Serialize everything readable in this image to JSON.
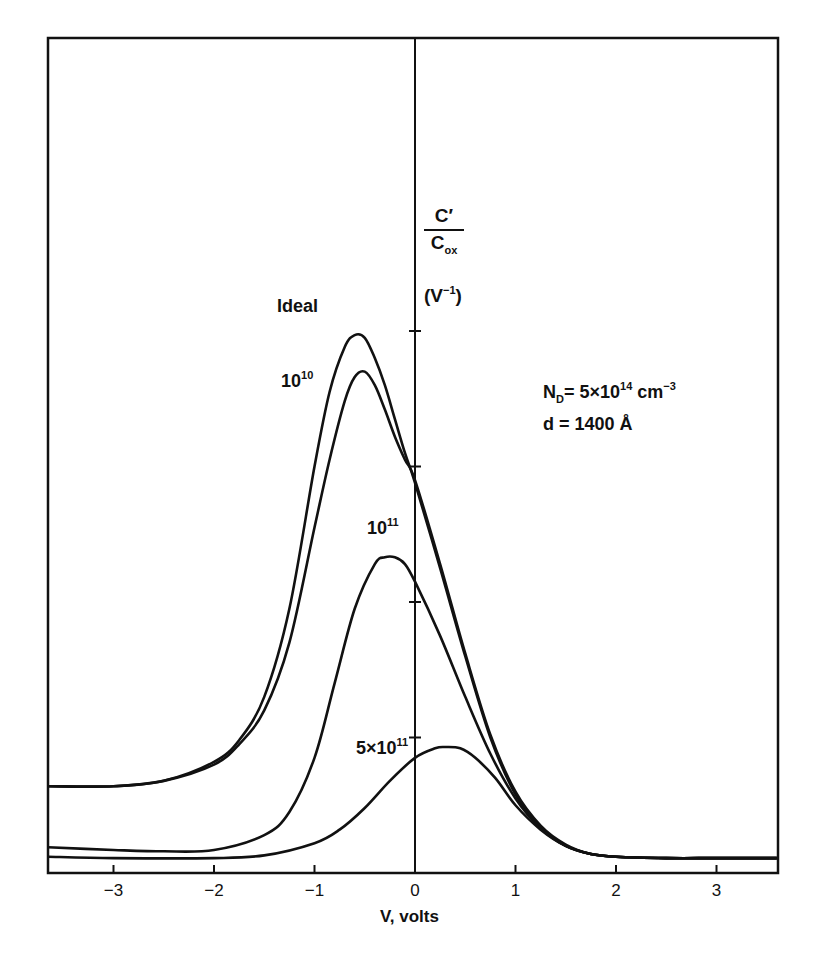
{
  "chart_data": {
    "type": "line",
    "title": "",
    "xlabel": "V, volts",
    "ylabel": "C′/C_ox (V⁻¹)",
    "ylabel_parts": {
      "numerator": "C′",
      "denominator_base": "C",
      "denominator_sub": "ox",
      "unit_base": "(V",
      "unit_sup": "−1",
      "unit_close": ")"
    },
    "xlim": [
      -3.65,
      3.6
    ],
    "ylim": [
      0,
      4.6
    ],
    "x_ticks": [
      -3,
      -2,
      -1,
      0,
      1,
      2,
      3
    ],
    "x_tick_labels": [
      "−3",
      "−2",
      "−1",
      "0",
      "1",
      "2",
      "3"
    ],
    "y_ticks": [
      1,
      2,
      3,
      4
    ],
    "y_tick_labels": [],
    "grid": false,
    "legend_position": "inline labels",
    "annotations": {
      "nd_label": {
        "base": "N",
        "sub": "D",
        "eq": "= 5×10",
        "exp": "14",
        "unit": " cm",
        "unit_exp": "−3"
      },
      "d_label": "d = 1400 Å"
    },
    "series": [
      {
        "name": "Ideal",
        "label": {
          "base": "Ideal",
          "exp": ""
        },
        "x": [
          -3.65,
          -3.0,
          -2.5,
          -2.0,
          -1.75,
          -1.5,
          -1.25,
          -1.0,
          -0.85,
          -0.7,
          -0.6,
          -0.5,
          -0.4,
          -0.3,
          -0.2,
          -0.1,
          0.0,
          0.25,
          0.5,
          0.75,
          1.0,
          1.25,
          1.5,
          1.75,
          2.0,
          2.5,
          3.0,
          3.6
        ],
        "y": [
          0.64,
          0.64,
          0.68,
          0.82,
          0.98,
          1.3,
          1.95,
          3.0,
          3.55,
          3.88,
          3.97,
          3.95,
          3.8,
          3.6,
          3.35,
          3.1,
          2.88,
          2.25,
          1.6,
          1.0,
          0.58,
          0.34,
          0.2,
          0.14,
          0.12,
          0.11,
          0.11,
          0.11
        ]
      },
      {
        "name": "1e10",
        "label": {
          "base": "10",
          "exp": "10"
        },
        "x": [
          -3.65,
          -3.0,
          -2.5,
          -2.0,
          -1.75,
          -1.5,
          -1.25,
          -1.0,
          -0.85,
          -0.7,
          -0.6,
          -0.5,
          -0.4,
          -0.3,
          -0.2,
          -0.1,
          0.0,
          0.25,
          0.5,
          0.75,
          1.0,
          1.25,
          1.5,
          1.75,
          2.0,
          2.5,
          3.0,
          3.6
        ],
        "y": [
          0.64,
          0.64,
          0.68,
          0.8,
          0.95,
          1.2,
          1.7,
          2.55,
          3.05,
          3.48,
          3.66,
          3.7,
          3.6,
          3.42,
          3.22,
          3.05,
          2.9,
          2.28,
          1.62,
          1.02,
          0.6,
          0.35,
          0.21,
          0.14,
          0.12,
          0.11,
          0.11,
          0.11
        ]
      },
      {
        "name": "1e11",
        "label": {
          "base": "10",
          "exp": "11"
        },
        "x": [
          -3.65,
          -3.0,
          -2.5,
          -2.0,
          -1.5,
          -1.25,
          -1.0,
          -0.8,
          -0.6,
          -0.4,
          -0.3,
          -0.2,
          -0.1,
          0.0,
          0.25,
          0.5,
          0.75,
          1.0,
          1.25,
          1.5,
          1.75,
          2.0,
          2.5,
          3.0,
          3.6
        ],
        "y": [
          0.19,
          0.17,
          0.16,
          0.17,
          0.28,
          0.45,
          0.85,
          1.4,
          1.95,
          2.28,
          2.33,
          2.33,
          2.28,
          2.15,
          1.75,
          1.3,
          0.88,
          0.55,
          0.33,
          0.2,
          0.14,
          0.12,
          0.11,
          0.11,
          0.11
        ]
      },
      {
        "name": "5e11",
        "label": {
          "base": "5×10",
          "exp": "11"
        },
        "x": [
          -3.65,
          -3.0,
          -2.0,
          -1.5,
          -1.0,
          -0.75,
          -0.5,
          -0.25,
          0.0,
          0.2,
          0.3,
          0.45,
          0.6,
          0.8,
          1.0,
          1.25,
          1.5,
          1.75,
          2.0,
          2.5,
          3.0,
          3.6
        ],
        "y": [
          0.12,
          0.11,
          0.11,
          0.13,
          0.22,
          0.32,
          0.48,
          0.68,
          0.85,
          0.92,
          0.93,
          0.92,
          0.85,
          0.7,
          0.5,
          0.32,
          0.2,
          0.14,
          0.12,
          0.11,
          0.11,
          0.11
        ]
      }
    ],
    "label_positions": {
      "Ideal": {
        "x": 277,
        "y": 310
      },
      "1e10": {
        "x": 281,
        "y": 383
      },
      "1e11": {
        "x": 367,
        "y": 530
      },
      "5e11": {
        "x": 356,
        "y": 750
      }
    }
  },
  "layout": {
    "plot_left_px": 48,
    "plot_right_px": 778,
    "plot_top_px": 38,
    "plot_bottom_px": 873,
    "x_zero_px": 415,
    "px_per_volt": 100.5,
    "px_per_yunit": 135.5,
    "line_color": "#111111",
    "bg_color": "#ffffff"
  }
}
